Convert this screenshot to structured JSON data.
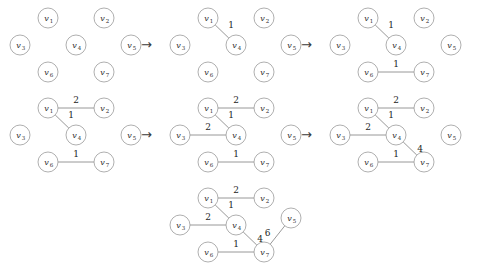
{
  "figure": {
    "title": "",
    "arrow_glyph": "→"
  },
  "style": {
    "node_radius": 10,
    "node_stroke": "#9a9a9a",
    "edge_stroke": "#8d8d8d",
    "text_color": "#2b2b2b",
    "background": "#ffffff"
  },
  "node_positions": {
    "v1": {
      "x": 48,
      "y": 18
    },
    "v2": {
      "x": 104,
      "y": 18
    },
    "v3": {
      "x": 20,
      "y": 45
    },
    "v4": {
      "x": 76,
      "y": 45
    },
    "v5": {
      "x": 131,
      "y": 45
    },
    "v6": {
      "x": 48,
      "y": 72
    },
    "v7": {
      "x": 104,
      "y": 72
    }
  },
  "nodes": [
    {
      "id": "v1",
      "base": "v",
      "sub": "1"
    },
    {
      "id": "v2",
      "base": "v",
      "sub": "2"
    },
    {
      "id": "v3",
      "base": "v",
      "sub": "3"
    },
    {
      "id": "v4",
      "base": "v",
      "sub": "4"
    },
    {
      "id": "v5",
      "base": "v",
      "sub": "5"
    },
    {
      "id": "v6",
      "base": "v",
      "sub": "6"
    },
    {
      "id": "v7",
      "base": "v",
      "sub": "7"
    }
  ],
  "panels": [
    {
      "name": "step-1",
      "row": 1,
      "x": 0,
      "y": 0,
      "nodes": [
        "v1",
        "v2",
        "v3",
        "v4",
        "v5",
        "v6",
        "v7"
      ],
      "edges": []
    },
    {
      "name": "step-2",
      "row": 1,
      "x": 160,
      "y": 0,
      "nodes": [
        "v1",
        "v2",
        "v3",
        "v4",
        "v5",
        "v6",
        "v7"
      ],
      "edges": [
        {
          "from": "v1",
          "to": "v4",
          "weight": "1",
          "label_dx": 9,
          "label_dy": -4
        }
      ]
    },
    {
      "name": "step-3",
      "row": 1,
      "x": 320,
      "y": 0,
      "nodes": [
        "v1",
        "v2",
        "v3",
        "v4",
        "v5",
        "v6",
        "v7"
      ],
      "edges": [
        {
          "from": "v1",
          "to": "v4",
          "weight": "1",
          "label_dx": 9,
          "label_dy": -4
        },
        {
          "from": "v6",
          "to": "v7",
          "weight": "1",
          "label_dx": 0,
          "label_dy": -5
        }
      ]
    },
    {
      "name": "step-4",
      "row": 2,
      "x": 0,
      "y": 90,
      "nodes": [
        "v1",
        "v2",
        "v3",
        "v4",
        "v5",
        "v6",
        "v7"
      ],
      "edges": [
        {
          "from": "v1",
          "to": "v2",
          "weight": "2",
          "label_dx": 0,
          "label_dy": -5
        },
        {
          "from": "v1",
          "to": "v4",
          "weight": "1",
          "label_dx": 9,
          "label_dy": -4
        },
        {
          "from": "v6",
          "to": "v7",
          "weight": "1",
          "label_dx": 0,
          "label_dy": -5
        }
      ]
    },
    {
      "name": "step-5",
      "row": 2,
      "x": 160,
      "y": 90,
      "nodes": [
        "v1",
        "v2",
        "v3",
        "v4",
        "v5",
        "v6",
        "v7"
      ],
      "edges": [
        {
          "from": "v1",
          "to": "v2",
          "weight": "2",
          "label_dx": 0,
          "label_dy": -5
        },
        {
          "from": "v1",
          "to": "v4",
          "weight": "1",
          "label_dx": 9,
          "label_dy": -4
        },
        {
          "from": "v3",
          "to": "v4",
          "weight": "2",
          "label_dx": 0,
          "label_dy": -5
        },
        {
          "from": "v6",
          "to": "v7",
          "weight": "1",
          "label_dx": 0,
          "label_dy": -5
        }
      ]
    },
    {
      "name": "step-6",
      "row": 2,
      "x": 320,
      "y": 90,
      "nodes": [
        "v1",
        "v2",
        "v3",
        "v4",
        "v5",
        "v6",
        "v7"
      ],
      "edges": [
        {
          "from": "v1",
          "to": "v2",
          "weight": "2",
          "label_dx": 0,
          "label_dy": -5
        },
        {
          "from": "v1",
          "to": "v4",
          "weight": "1",
          "label_dx": 9,
          "label_dy": -4
        },
        {
          "from": "v3",
          "to": "v4",
          "weight": "2",
          "label_dx": 0,
          "label_dy": -5
        },
        {
          "from": "v4",
          "to": "v7",
          "weight": "4",
          "label_dx": 10,
          "label_dy": 3
        },
        {
          "from": "v6",
          "to": "v7",
          "weight": "1",
          "label_dx": 0,
          "label_dy": -5
        }
      ]
    },
    {
      "name": "step-7",
      "row": 3,
      "x": 160,
      "y": 180,
      "node_overrides": {
        "v5": {
          "x": 131,
          "y": 38
        }
      },
      "nodes": [
        "v1",
        "v2",
        "v3",
        "v4",
        "v5",
        "v6",
        "v7"
      ],
      "edges": [
        {
          "from": "v1",
          "to": "v2",
          "weight": "2",
          "label_dx": 0,
          "label_dy": -5
        },
        {
          "from": "v1",
          "to": "v4",
          "weight": "1",
          "label_dx": 9,
          "label_dy": -4
        },
        {
          "from": "v3",
          "to": "v4",
          "weight": "2",
          "label_dx": 0,
          "label_dy": -5
        },
        {
          "from": "v4",
          "to": "v7",
          "weight": "4",
          "label_dx": 10,
          "label_dy": 3
        },
        {
          "from": "v5",
          "to": "v7",
          "weight": "6",
          "label_dx": -10,
          "label_dy": 1
        },
        {
          "from": "v6",
          "to": "v7",
          "weight": "1",
          "label_dx": 0,
          "label_dy": -5
        }
      ]
    }
  ],
  "arrows": [
    {
      "name": "arrow-step1-step2",
      "x": 141,
      "y": 38,
      "glyph": "→"
    },
    {
      "name": "arrow-step2-step3",
      "x": 301,
      "y": 38,
      "glyph": "→"
    },
    {
      "name": "arrow-step4-step5",
      "x": 141,
      "y": 128,
      "glyph": "→"
    },
    {
      "name": "arrow-step5-step6",
      "x": 301,
      "y": 128,
      "glyph": "→"
    }
  ]
}
